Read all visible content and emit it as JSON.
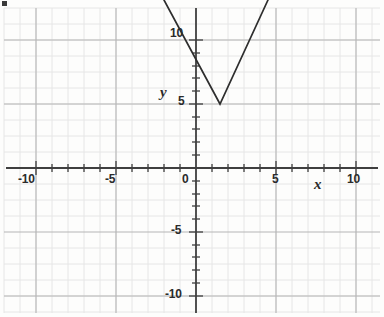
{
  "figure": {
    "kind": "coordinate-grid-graph",
    "background_color": "#fdfdfc",
    "grid_minor_color": "#e3e3e3",
    "grid_major_color": "#b4b4b4",
    "axis_color": "#3f3f3f",
    "curve_color": "#2e2e2e",
    "corner_mark_color": "#3a3a3a"
  },
  "axes": {
    "x_label": "x",
    "y_label": "y",
    "x_tick_labels": [
      "-10",
      "-5",
      "0",
      "5",
      "10"
    ],
    "y_tick_labels": [
      "10",
      "5",
      "-5",
      "-10"
    ],
    "origin_label": "0"
  },
  "chart_data": {
    "type": "line",
    "title": "",
    "xlabel": "x",
    "ylabel": "y",
    "xlim": [
      -11.5,
      11.5
    ],
    "ylim": [
      -11.5,
      11.5
    ],
    "xticks": [
      -10,
      -5,
      0,
      5,
      10
    ],
    "yticks": [
      -10,
      -5,
      5,
      10
    ],
    "minor_tick_step": 1,
    "grid": true,
    "grid_major_step": 5,
    "grid_minor_step": 1.25,
    "legend": null,
    "series": [
      {
        "name": "absolute value graph",
        "shape": "V",
        "vertex": [
          1.5,
          4
        ],
        "x": [
          -2,
          1.5,
          4.5
        ],
        "y": [
          10.5,
          4,
          10.5
        ],
        "left_slope": -1.857,
        "right_slope": 2.167
      }
    ],
    "annotations": []
  }
}
